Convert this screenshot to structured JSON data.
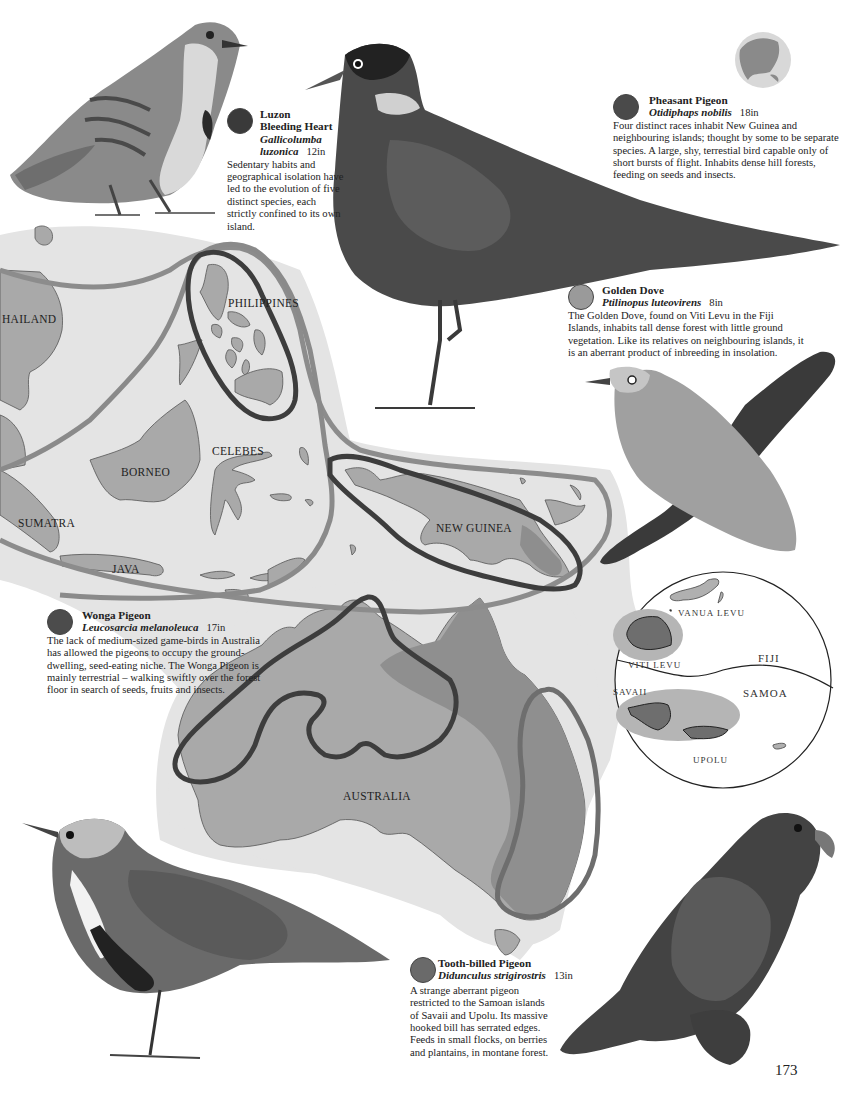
{
  "page": {
    "page_number": "173"
  },
  "species": [
    {
      "id": "luzon-bleeding-heart",
      "common_name_line1": "Luzon",
      "common_name_line2": "Bleeding Heart",
      "scientific_line1": "Gallicolumba",
      "scientific_line2": "luzonica",
      "size": "12in",
      "marker_color": "#3a3a3a",
      "description": "Sedentary habits and geographical isolation have led to the evolution of five distinct species, each strictly confined to its own island."
    },
    {
      "id": "pheasant-pigeon",
      "common_name": "Pheasant Pigeon",
      "scientific_name": "Otidiphaps nobilis",
      "size": "18in",
      "marker_color": "#4a4a4a",
      "description": "Four distinct races inhabit New Guinea and neighbouring islands; thought by some to be separate species. A large, shy, terrestial bird capable only of short bursts of flight. Inhabits dense hill forests, feeding on seeds and insects."
    },
    {
      "id": "golden-dove",
      "common_name": "Golden Dove",
      "scientific_name": "Ptilinopus luteovirens",
      "size": "8in",
      "marker_color": "#9a9a9a",
      "description": "The Golden Dove, found on Viti Levu in the Fiji Islands, inhabits tall dense forest with little ground vegetation. Like its relatives on neighbouring islands, it is an aberrant product of inbreeding in insolation."
    },
    {
      "id": "wonga-pigeon",
      "common_name": "Wonga Pigeon",
      "scientific_name": "Leucosarcia melanoleuca",
      "size": "17in",
      "marker_color": "#4c4c4c",
      "description": "The lack of medium-sized game-birds in Australia has allowed the pigeons to occupy the ground-dwelling, seed-eating niche. The Wonga Pigeon is mainly terrestrial – walking swiftly over the forest floor in search of seeds, fruits and insects."
    },
    {
      "id": "tooth-billed-pigeon",
      "common_name": "Tooth-billed Pigeon",
      "scientific_name": "Didunculus strigirostris",
      "size": "13in",
      "marker_color": "#6a6a6a",
      "description": "A strange aberrant pigeon restricted to the Samoan islands of Savaii and Upolu. Its massive hooked bill has serrated edges. Feeds in small flocks, on berries and plantains, in montane forest."
    }
  ],
  "map": {
    "labels": {
      "thailand": "HAILAND",
      "philippines": "PHILIPPINES",
      "borneo": "BORNEO",
      "celebes": "CELEBES",
      "sumatra": "SUMATRA",
      "java": "JAVA",
      "new_guinea": "NEW GUINEA",
      "australia": "AUSTRALIA"
    },
    "colors": {
      "sea_shade": "#e2e2e2",
      "land": "#a9a9a9",
      "land_dark": "#8e8e8e",
      "range_dark": "#3d3d3d",
      "range_light": "#8c8c8c"
    }
  },
  "inset": {
    "labels": {
      "vanua_levu": "VANUA LEVU",
      "viti_levu": "VITI LEVU",
      "fiji": "FIJI",
      "savaii": "SAVAII",
      "samoa": "SAMOA",
      "upolu": "UPOLU"
    }
  }
}
